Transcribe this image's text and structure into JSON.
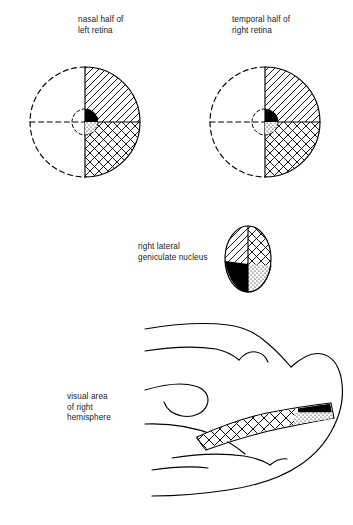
{
  "figure": {
    "background_color": "#ffffff",
    "ink_color": "#000000",
    "width": 353,
    "height": 525
  },
  "labels": {
    "nasal_left_retina": "nasal half of\nleft retina",
    "temporal_right_retina": "temporal half of\nright retina",
    "lgn": "right lateral\ngeniculate nucleus",
    "visual_area": "visual area\nof right\nhemisphere"
  },
  "legend_regions": {
    "upper_quadrant": "diagonal-hatch",
    "lower_quadrant": "cross-hatch",
    "central_upper": "solid-black",
    "central_lower": "stipple-dots"
  },
  "retinas": [
    {
      "name": "left-retina",
      "label_key": "nasal_half_of_left_retina",
      "cx": 85,
      "cy": 122,
      "radius": 55,
      "left_half_outline": "dashed",
      "right_half_outline": "solid",
      "vertical_meridian": "solid",
      "horizontal_meridian": "dashed-left-solid-right",
      "quadrants": {
        "upper_right": "diagonal-hatch",
        "lower_right": "cross-hatch",
        "upper_left": "blank",
        "lower_left": "blank"
      },
      "macula": {
        "radius": 13,
        "outline": "dashed",
        "upper_right": "solid-black",
        "lower_right": "stipple-dots"
      }
    },
    {
      "name": "right-retina",
      "label_key": "temporal_half_of_right_retina",
      "cx": 265,
      "cy": 122,
      "radius": 55,
      "left_half_outline": "dashed",
      "right_half_outline": "solid",
      "vertical_meridian": "solid",
      "horizontal_meridian": "dashed-left-solid-right",
      "quadrants": {
        "upper_right": "diagonal-hatch",
        "lower_right": "cross-hatch",
        "upper_left": "blank",
        "lower_left": "blank"
      },
      "macula": {
        "radius": 13,
        "outline": "dashed",
        "upper_right": "solid-black",
        "lower_right": "stipple-dots"
      }
    }
  ],
  "lgn": {
    "name": "right-lateral-geniculate-nucleus",
    "cx": 248,
    "cy": 259,
    "rx": 23,
    "ry": 33,
    "halves": {
      "left": "diagonal-hatch",
      "right": "cross-hatch"
    },
    "foveal_regions": {
      "lower_left": "solid-black",
      "lower_right": "stipple-dots"
    }
  },
  "cortex": {
    "name": "right-hemisphere-medial-view",
    "calcarine_band": {
      "body": "cross-hatch",
      "occipital_pole_upper": "solid-black",
      "occipital_pole_lower": "stipple-dots"
    },
    "sulci_count": 7
  }
}
